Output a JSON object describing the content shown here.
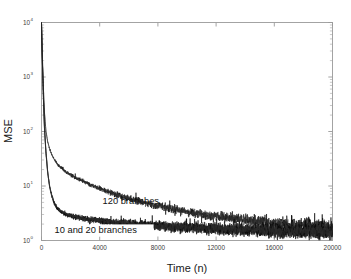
{
  "chart_data": {
    "type": "line",
    "title": "",
    "xlabel": "Time (n)",
    "ylabel": "MSE",
    "xlim": [
      0,
      20000
    ],
    "ylim": [
      1,
      10000
    ],
    "yscale": "log",
    "xscale": "linear",
    "grid": false,
    "legend_position": "none",
    "xticks": [
      0,
      4000,
      8000,
      12000,
      16000,
      20000
    ],
    "xticklabels": [
      "0",
      "4000",
      "8000",
      "12000",
      "16000",
      "20000"
    ],
    "yticks": [
      1,
      10,
      100,
      1000,
      10000
    ],
    "yticklabels": [
      "10",
      "10",
      "10",
      "10",
      "10"
    ],
    "ytick_exponents": [
      "0",
      "1",
      "2",
      "3",
      "4"
    ],
    "annotations": [
      {
        "text": "120 branches",
        "x": 4200,
        "y": 4.6
      },
      {
        "text": "10 and 20 branches",
        "x": 900,
        "y": 1.35
      }
    ],
    "series": [
      {
        "name": "120 branches",
        "color": "#0a0a0a",
        "description": "MSE learning curve for 120 branches; slower convergence, upper trace",
        "x": [
          0,
          60,
          130,
          200,
          300,
          420,
          560,
          720,
          900,
          1100,
          1350,
          1650,
          2000,
          2400,
          2850,
          3350,
          3900,
          4500,
          5200,
          6000,
          6900,
          7900,
          9000,
          10200,
          11500,
          12900,
          14400,
          16000,
          17700,
          19000,
          20000
        ],
        "y": [
          9800,
          2400,
          620,
          230,
          105,
          66,
          48,
          37,
          30,
          25,
          21.5,
          18.5,
          16,
          14,
          12.2,
          10.6,
          9.2,
          8.0,
          6.9,
          5.9,
          5.1,
          4.4,
          3.8,
          3.3,
          2.9,
          2.6,
          2.35,
          2.1,
          1.95,
          1.85,
          1.8
        ]
      },
      {
        "name": "20 branches",
        "color": "#0a0a0a",
        "description": "MSE learning curve for 20 branches; fast convergence, lower trace",
        "x": [
          0,
          60,
          130,
          200,
          300,
          420,
          560,
          720,
          900,
          1100,
          1350,
          1650,
          2000,
          2400,
          2850,
          3350,
          3900,
          4500,
          5200,
          6000,
          6900,
          7900,
          9000,
          10200,
          11500,
          12900,
          14400,
          16000,
          17700,
          19000,
          20000
        ],
        "y": [
          9800,
          1900,
          420,
          120,
          42,
          18,
          9.5,
          6.2,
          4.6,
          3.8,
          3.3,
          3.0,
          2.8,
          2.65,
          2.5,
          2.4,
          2.3,
          2.2,
          2.1,
          2.0,
          1.92,
          1.85,
          1.78,
          1.72,
          1.66,
          1.6,
          1.55,
          1.5,
          1.46,
          1.43,
          1.4
        ]
      },
      {
        "name": "10 branches",
        "color": "#0a0a0a",
        "description": "MSE learning curve for 10 branches; nearly identical to 20 branches, lower trace",
        "x": [
          0,
          60,
          130,
          200,
          300,
          420,
          560,
          720,
          900,
          1100,
          1350,
          1650,
          2000,
          2400,
          2850,
          3350,
          3900,
          4500,
          5200,
          6000,
          6900,
          7900,
          9000,
          10200,
          11500,
          12900,
          14400,
          16000,
          17700,
          19000,
          20000
        ],
        "y": [
          9800,
          2000,
          450,
          130,
          45,
          19,
          10.0,
          6.5,
          4.8,
          3.95,
          3.45,
          3.1,
          2.9,
          2.72,
          2.58,
          2.46,
          2.36,
          2.26,
          2.15,
          2.05,
          1.96,
          1.88,
          1.8,
          1.74,
          1.68,
          1.62,
          1.57,
          1.52,
          1.48,
          1.45,
          1.42
        ]
      }
    ]
  }
}
